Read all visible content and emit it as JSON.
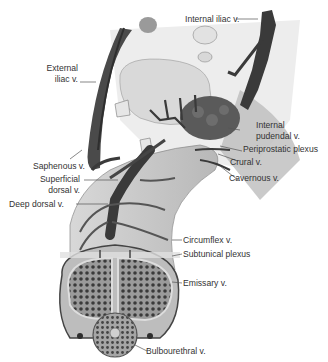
{
  "figure": {
    "type": "anatomical-illustration",
    "colors": {
      "vein": "#3a3a3a",
      "tissue": "#cfcfcf",
      "bone": "#e6e6e6",
      "cavernous": "#6a6a6a",
      "label_text": "#333333",
      "leader_line": "#555555"
    },
    "labels": {
      "internal_iliac": "Internal iliac v.",
      "external_iliac_1": "External",
      "external_iliac_2": "iliac v.",
      "internal_pudendal_1": "Internal",
      "internal_pudendal_2": "pudendal v.",
      "periprostatic": "Periprostatic plexus",
      "crural": "Crural v.",
      "cavernous": "Cavernous v.",
      "saphenous": "Saphenous v.",
      "superficial_dorsal_1": "Superficial",
      "superficial_dorsal_2": "dorsal v.",
      "deep_dorsal": "Deep dorsal v.",
      "circumflex": "Circumflex v.",
      "subtunical": "Subtunical plexus",
      "emissary": "Emissary v.",
      "bulbourethral": "Bulbourethral v."
    }
  }
}
